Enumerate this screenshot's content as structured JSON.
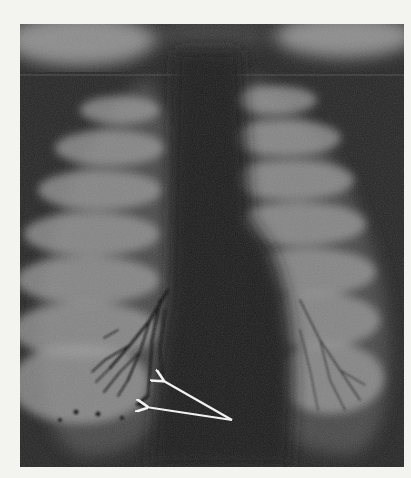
{
  "image": {
    "kind": "chest-radiograph-bronchogram",
    "width": 411,
    "height": 478,
    "paper_color": "#f3f3f0",
    "frame": {
      "x": 20,
      "y": 24,
      "w": 384,
      "h": 443
    },
    "colors": {
      "background_dark": "#262626",
      "mediastinum": "#1c1c1c",
      "lung_field": "#4a4a4a",
      "rib_light": "#9a9a9a",
      "shoulder_light": "#8c8c8c",
      "contrast_branches": "#101010",
      "arrow": "#f2f2f2"
    },
    "ribs_left": [
      {
        "cx": 120,
        "cy": 110,
        "rx": 40,
        "ry": 14
      },
      {
        "cx": 110,
        "cy": 148,
        "rx": 55,
        "ry": 18
      },
      {
        "cx": 100,
        "cy": 190,
        "rx": 62,
        "ry": 20
      },
      {
        "cx": 92,
        "cy": 234,
        "rx": 68,
        "ry": 22
      },
      {
        "cx": 88,
        "cy": 280,
        "rx": 72,
        "ry": 24
      },
      {
        "cx": 86,
        "cy": 330,
        "rx": 74,
        "ry": 28
      },
      {
        "cx": 80,
        "cy": 384,
        "rx": 70,
        "ry": 40
      }
    ],
    "ribs_right": [
      {
        "cx": 275,
        "cy": 100,
        "rx": 42,
        "ry": 14
      },
      {
        "cx": 285,
        "cy": 138,
        "rx": 56,
        "ry": 18
      },
      {
        "cx": 292,
        "cy": 180,
        "rx": 62,
        "ry": 20
      },
      {
        "cx": 300,
        "cy": 224,
        "rx": 66,
        "ry": 22
      },
      {
        "cx": 310,
        "cy": 272,
        "rx": 66,
        "ry": 24
      },
      {
        "cx": 318,
        "cy": 320,
        "rx": 62,
        "ry": 28
      },
      {
        "cx": 330,
        "cy": 378,
        "rx": 54,
        "ry": 36
      }
    ],
    "annotations": {
      "arrows": [
        {
          "from": [
            232,
            420
          ],
          "to": [
            162,
            380
          ]
        },
        {
          "from": [
            232,
            420
          ],
          "to": [
            146,
            407
          ]
        }
      ]
    }
  }
}
